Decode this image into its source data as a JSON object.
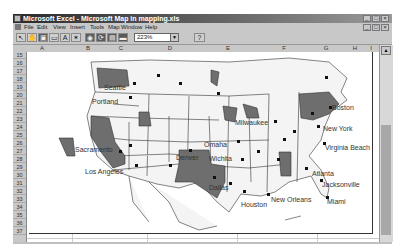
{
  "window": {
    "title": "Microsoft Excel - Microsoft Map in mapping.xls",
    "controls": [
      "minimize",
      "maximize",
      "close"
    ]
  },
  "menubar": {
    "items": [
      "File",
      "Edit",
      "View",
      "Insert",
      "Tools",
      "Map",
      "Window",
      "Help"
    ]
  },
  "toolbar": {
    "buttons": [
      {
        "name": "select-objects",
        "glyph": "↖"
      },
      {
        "name": "grabber",
        "glyph": "✋"
      },
      {
        "name": "center-map",
        "glyph": "▣"
      },
      {
        "name": "map-labels",
        "glyph": "▭"
      },
      {
        "name": "add-text",
        "glyph": "A"
      },
      {
        "name": "custom-pin-map",
        "glyph": "✶"
      },
      {
        "name": "display-entire",
        "glyph": "◉"
      },
      {
        "name": "redraw-map",
        "glyph": "⟳"
      },
      {
        "name": "map-refresh",
        "glyph": "▤"
      },
      {
        "name": "show-control",
        "glyph": "▬"
      }
    ],
    "zoom_value": "223%",
    "help_glyph": "?"
  },
  "columns": [
    "A",
    "B",
    "C",
    "D",
    "E",
    "F",
    "G",
    "H",
    "I"
  ],
  "rows": [
    "15",
    "16",
    "17",
    "18",
    "19",
    "20",
    "21",
    "22",
    "23",
    "24",
    "25",
    "26",
    "27",
    "28",
    "29",
    "30",
    "31",
    "32",
    "33",
    "34",
    "35",
    "36",
    "37"
  ],
  "map": {
    "cities": [
      {
        "label": "Seattle",
        "x": 75,
        "y": 32
      },
      {
        "label": "Portland",
        "x": 65,
        "y": 45
      },
      {
        "label": "Sacramento",
        "x": 46,
        "y": 94
      },
      {
        "label": "Los Angeles",
        "x": 56,
        "y": 115
      },
      {
        "label": "Denver",
        "x": 148,
        "y": 102
      },
      {
        "label": "Omaha",
        "x": 176,
        "y": 90
      },
      {
        "label": "Wichita",
        "x": 182,
        "y": 104
      },
      {
        "label": "Milwaukee",
        "x": 206,
        "y": 67
      },
      {
        "label": "Dallas",
        "x": 178,
        "y": 131
      },
      {
        "label": "Houston",
        "x": 210,
        "y": 148
      },
      {
        "label": "New Orleans",
        "x": 240,
        "y": 143
      },
      {
        "label": "Atlanta",
        "x": 280,
        "y": 117
      },
      {
        "label": "Jacksonville",
        "x": 291,
        "y": 128
      },
      {
        "label": "Miami",
        "x": 296,
        "y": 145
      },
      {
        "label": "Boston",
        "x": 303,
        "y": 52
      },
      {
        "label": "New York",
        "x": 295,
        "y": 72
      },
      {
        "label": "Virginia Beach",
        "x": 297,
        "y": 92
      }
    ],
    "highlight_color": "#6e6e6e",
    "land_color": "#f4f4f4",
    "border_color": "#333333"
  }
}
